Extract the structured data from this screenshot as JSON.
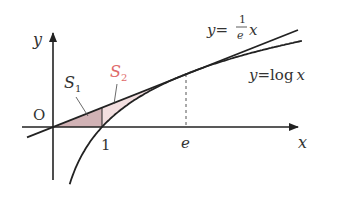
{
  "diagram": {
    "type": "function-graph",
    "axes": {
      "x_label": "x",
      "y_label": "y",
      "origin_label": "O"
    },
    "ticks": {
      "x1": "1",
      "xe": "e"
    },
    "curves": [
      {
        "name": "tangent-line",
        "label_lhs": "y=",
        "label_num": "1",
        "label_den": "e",
        "label_var": "x",
        "equation": "y=(1/e)x"
      },
      {
        "name": "log-curve",
        "label": "y=log x",
        "label_lhs": "y=",
        "label_fn": "log",
        "label_var": "x",
        "equation": "y=log x"
      }
    ],
    "regions": [
      {
        "name": "S1",
        "label_main": "S",
        "label_sub": "1",
        "color": "#c9a5a8",
        "label_color": "#444444"
      },
      {
        "name": "S2",
        "label_main": "S",
        "label_sub": "2",
        "color": "#f2dcdd",
        "label_color": "#e06a6a"
      }
    ],
    "colors": {
      "stroke": "#222222",
      "dashed": "#555555"
    }
  }
}
